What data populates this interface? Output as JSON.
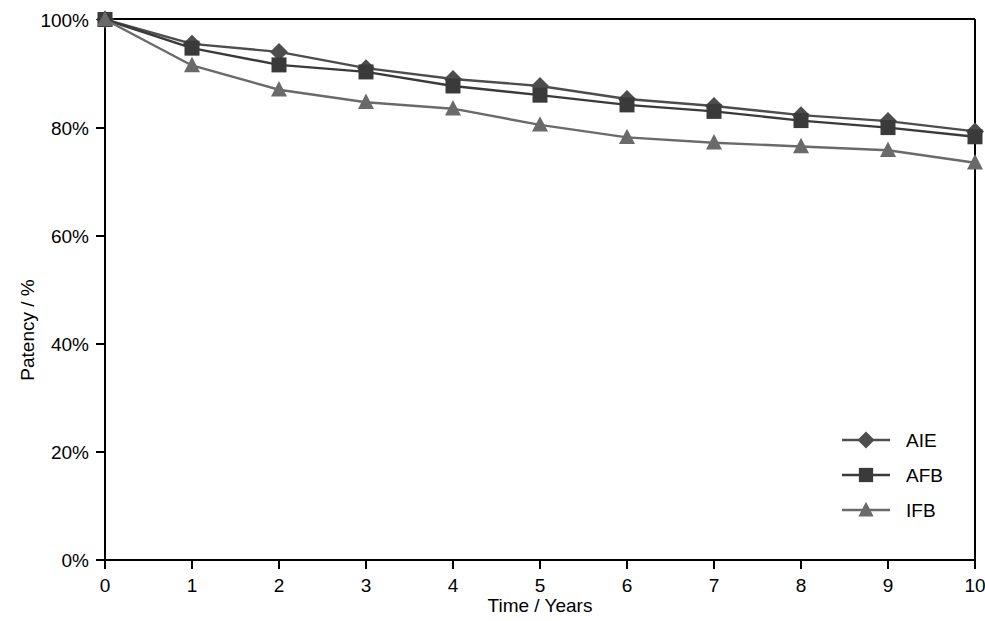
{
  "chart_data": {
    "type": "line",
    "title": "",
    "xlabel": "Time / Years",
    "ylabel": "Patency / %",
    "x": [
      0,
      1,
      2,
      3,
      4,
      5,
      6,
      7,
      8,
      9,
      10
    ],
    "xtick_labels": [
      "0",
      "1",
      "2",
      "3",
      "4",
      "5",
      "6",
      "7",
      "8",
      "9",
      "10"
    ],
    "ytick_labels": [
      "0%",
      "20%",
      "40%",
      "60%",
      "80%",
      "100%"
    ],
    "yticks": [
      0,
      20,
      40,
      60,
      80,
      100
    ],
    "xlim": [
      0,
      10
    ],
    "ylim": [
      0,
      100
    ],
    "grid": false,
    "legend_position": "lower right",
    "series": [
      {
        "name": "AIE",
        "marker": "diamond",
        "color": "#4d4d4d",
        "values": [
          100,
          95.5,
          94.0,
          91.0,
          89.0,
          87.7,
          85.3,
          84.0,
          82.3,
          81.2,
          79.3
        ]
      },
      {
        "name": "AFB",
        "marker": "square",
        "color": "#3a3a3a",
        "values": [
          100,
          94.7,
          91.6,
          90.3,
          87.7,
          86.0,
          84.2,
          83.0,
          81.3,
          80.0,
          78.3
        ]
      },
      {
        "name": "IFB",
        "marker": "triangle",
        "color": "#6a6a6a",
        "values": [
          100,
          91.5,
          87.0,
          84.7,
          83.5,
          80.5,
          78.2,
          77.2,
          76.5,
          75.8,
          73.5
        ]
      }
    ]
  },
  "legend": {
    "entries": [
      {
        "label": "AIE"
      },
      {
        "label": "AFB"
      },
      {
        "label": "IFB"
      }
    ]
  },
  "axes": {
    "x_title": "Time / Years",
    "y_title": "Patency / %"
  }
}
